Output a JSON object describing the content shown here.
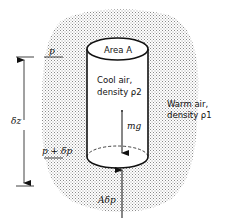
{
  "diagram": {
    "labels": {
      "area": "Area A",
      "cool_air_line1": "Cool air,",
      "cool_air_line2": "density ρ2",
      "warm_air_line1": "Warm air,",
      "warm_air_line2": "density ρ1",
      "weight": "mg",
      "pressure_force": "Aδp",
      "top_pressure": "p",
      "bottom_pressure": "p + δp",
      "height": "δz"
    },
    "colors": {
      "stroke": "#111111",
      "stipple": "#7a7a7a",
      "background": "#ffffff"
    }
  }
}
